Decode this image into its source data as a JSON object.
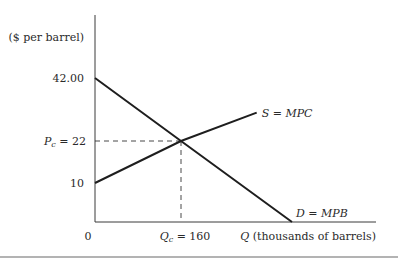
{
  "chart_data": {
    "type": "line",
    "title": "",
    "ylabel": "($ per barrel)",
    "xlabel": "Q (thousands of barrels)",
    "xlabel_var": "Q",
    "xlabel_rest": " (thousands of barrels)",
    "origin_label": "0",
    "y_ticks": [
      {
        "value": 42,
        "label": "42.00"
      },
      {
        "value": 10,
        "label": "10"
      }
    ],
    "equilibrium": {
      "price": 22,
      "quantity": 160,
      "price_label_var": "P",
      "price_label_sub": "c",
      "price_label_rest": " = 22",
      "quantity_label_var": "Q",
      "quantity_label_sub": "c",
      "quantity_label_rest": " = 160"
    },
    "series": [
      {
        "name": "S = MPC",
        "label_var": "S",
        "label_rest": " = ",
        "label_italic": "MPC",
        "points": [
          [
            0,
            10
          ],
          [
            160,
            22
          ],
          [
            280,
            31
          ]
        ]
      },
      {
        "name": "D = MPB",
        "label_var": "D",
        "label_rest": " = ",
        "label_italic": "MPB",
        "points": [
          [
            0,
            42
          ],
          [
            160,
            22
          ],
          [
            336,
            0
          ]
        ]
      }
    ],
    "xlim": [
      0,
      400
    ],
    "ylim": [
      0,
      50
    ],
    "grid": false,
    "legend": "inline labels at line ends"
  }
}
